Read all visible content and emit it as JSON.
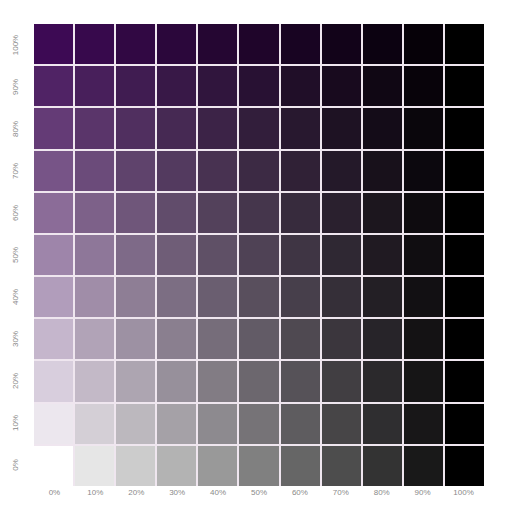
{
  "chart_data": {
    "type": "heatmap",
    "title": "",
    "xlabel": "",
    "ylabel": "",
    "x_tick_labels": [
      "0%",
      "10%",
      "20%",
      "30%",
      "40%",
      "50%",
      "60%",
      "70%",
      "80%",
      "90%",
      "100%"
    ],
    "y_tick_labels": [
      "100%",
      "90%",
      "80%",
      "70%",
      "60%",
      "50%",
      "40%",
      "30%",
      "20%",
      "10%",
      "0%"
    ],
    "x_meaning": "black mix percentage",
    "y_meaning": "purple tint percentage",
    "base_color": "#3d0a54",
    "black_color": "#000000",
    "grid_line_color": "#efe6ef",
    "label_color": "#8a8a8a",
    "legend": "none",
    "grid": true
  }
}
